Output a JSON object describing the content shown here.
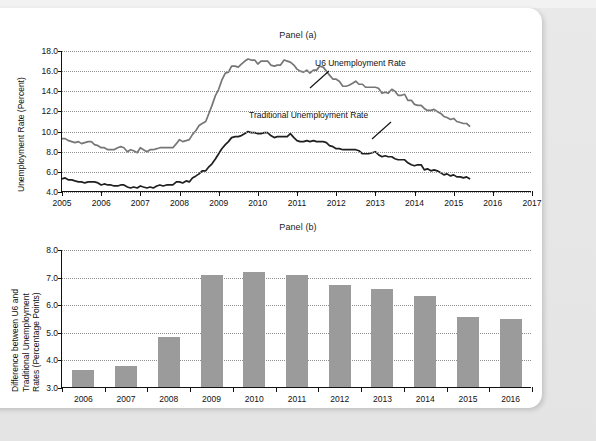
{
  "figure": {
    "panel_a_title": "Panel (a)",
    "panel_b_title": "Panel (b)"
  },
  "chart_data": [
    {
      "type": "line",
      "title": "Panel (a)",
      "xlabel": "",
      "ylabel": "Unemployment Rate (Percent)",
      "xlim": [
        2005,
        2017
      ],
      "ylim": [
        4.0,
        18.0
      ],
      "grid": true,
      "legend_position": "inline-annotation",
      "xticks": [
        "2005",
        "2006",
        "2007",
        "2008",
        "2009",
        "2010",
        "2011",
        "2012",
        "2013",
        "2014",
        "2015",
        "2016",
        "2017"
      ],
      "yticks": [
        "4.0",
        "6.0",
        "8.0",
        "10.0",
        "12.0",
        "14.0",
        "16.0",
        "18.0"
      ],
      "annotations": [
        {
          "text": "U6 Unemployment Rate",
          "points_to_series": "U6 Unemployment Rate"
        },
        {
          "text": "Traditional Unemployment Rate",
          "points_to_series": "Traditional Unemployment Rate"
        }
      ],
      "series": [
        {
          "name": "U6 Unemployment Rate",
          "color": "#767676",
          "x": [
            2005.0,
            2005.08,
            2005.17,
            2005.25,
            2005.33,
            2005.42,
            2005.5,
            2005.58,
            2005.67,
            2005.75,
            2005.83,
            2005.92,
            2006.0,
            2006.08,
            2006.17,
            2006.25,
            2006.33,
            2006.42,
            2006.5,
            2006.58,
            2006.67,
            2006.75,
            2006.83,
            2006.92,
            2007.0,
            2007.08,
            2007.17,
            2007.25,
            2007.33,
            2007.42,
            2007.5,
            2007.58,
            2007.67,
            2007.75,
            2007.83,
            2007.92,
            2008.0,
            2008.08,
            2008.17,
            2008.25,
            2008.33,
            2008.42,
            2008.5,
            2008.58,
            2008.67,
            2008.75,
            2008.83,
            2008.92,
            2009.0,
            2009.08,
            2009.17,
            2009.25,
            2009.33,
            2009.42,
            2009.5,
            2009.58,
            2009.67,
            2009.75,
            2009.83,
            2009.92,
            2010.0,
            2010.08,
            2010.17,
            2010.25,
            2010.33,
            2010.42,
            2010.5,
            2010.58,
            2010.67,
            2010.75,
            2010.83,
            2010.92,
            2011.0,
            2011.08,
            2011.17,
            2011.25,
            2011.33,
            2011.42,
            2011.5,
            2011.58,
            2011.67,
            2011.75,
            2011.83,
            2011.92,
            2012.0,
            2012.08,
            2012.17,
            2012.25,
            2012.33,
            2012.42,
            2012.5,
            2012.58,
            2012.67,
            2012.75,
            2012.83,
            2012.92,
            2013.0,
            2013.08,
            2013.17,
            2013.25,
            2013.33,
            2013.42,
            2013.5,
            2013.58,
            2013.67,
            2013.75,
            2013.83,
            2013.92,
            2014.0,
            2014.08,
            2014.17,
            2014.25,
            2014.33,
            2014.42,
            2014.5,
            2014.58,
            2014.67,
            2014.75,
            2014.83,
            2014.92,
            2015.0,
            2015.08,
            2015.17,
            2015.25,
            2015.33,
            2015.42
          ],
          "values": [
            9.3,
            9.3,
            9.1,
            9.0,
            8.9,
            9.0,
            8.8,
            8.9,
            9.0,
            9.0,
            8.7,
            8.6,
            8.4,
            8.4,
            8.2,
            8.2,
            8.2,
            8.4,
            8.5,
            8.4,
            8.0,
            8.2,
            8.1,
            7.9,
            8.4,
            8.2,
            8.0,
            8.2,
            8.2,
            8.3,
            8.4,
            8.4,
            8.4,
            8.4,
            8.4,
            8.8,
            9.2,
            9.0,
            9.1,
            9.2,
            9.7,
            10.1,
            10.6,
            10.8,
            11.0,
            11.8,
            12.6,
            13.6,
            14.2,
            15.1,
            15.8,
            15.9,
            16.5,
            16.5,
            16.4,
            16.7,
            17.0,
            17.2,
            17.1,
            17.1,
            16.7,
            17.0,
            17.0,
            17.0,
            16.6,
            16.5,
            16.6,
            16.6,
            17.1,
            17.0,
            16.9,
            16.6,
            16.2,
            16.0,
            15.9,
            16.1,
            15.8,
            16.1,
            16.1,
            16.5,
            16.4,
            16.0,
            15.6,
            15.2,
            15.2,
            15.0,
            14.5,
            14.5,
            14.6,
            14.8,
            15.0,
            14.7,
            14.7,
            14.4,
            14.4,
            14.4,
            14.4,
            14.3,
            13.8,
            13.9,
            13.8,
            14.2,
            14.0,
            13.6,
            13.6,
            13.7,
            13.1,
            13.1,
            12.7,
            12.6,
            12.6,
            12.3,
            12.1,
            12.1,
            12.2,
            12.0,
            11.8,
            11.5,
            11.4,
            11.2,
            11.3,
            11.0,
            10.9,
            10.8,
            10.8,
            10.5
          ]
        },
        {
          "name": "Traditional Unemployment Rate",
          "color": "#1f1f1f",
          "x": [
            2005.0,
            2005.08,
            2005.17,
            2005.25,
            2005.33,
            2005.42,
            2005.5,
            2005.58,
            2005.67,
            2005.75,
            2005.83,
            2005.92,
            2006.0,
            2006.08,
            2006.17,
            2006.25,
            2006.33,
            2006.42,
            2006.5,
            2006.58,
            2006.67,
            2006.75,
            2006.83,
            2006.92,
            2007.0,
            2007.08,
            2007.17,
            2007.25,
            2007.33,
            2007.42,
            2007.5,
            2007.58,
            2007.67,
            2007.75,
            2007.83,
            2007.92,
            2008.0,
            2008.08,
            2008.17,
            2008.25,
            2008.33,
            2008.42,
            2008.5,
            2008.58,
            2008.67,
            2008.75,
            2008.83,
            2008.92,
            2009.0,
            2009.08,
            2009.17,
            2009.25,
            2009.33,
            2009.42,
            2009.5,
            2009.58,
            2009.67,
            2009.75,
            2009.83,
            2009.92,
            2010.0,
            2010.08,
            2010.17,
            2010.25,
            2010.33,
            2010.42,
            2010.5,
            2010.58,
            2010.67,
            2010.75,
            2010.83,
            2010.92,
            2011.0,
            2011.08,
            2011.17,
            2011.25,
            2011.33,
            2011.42,
            2011.5,
            2011.58,
            2011.67,
            2011.75,
            2011.83,
            2011.92,
            2012.0,
            2012.08,
            2012.17,
            2012.25,
            2012.33,
            2012.42,
            2012.5,
            2012.58,
            2012.67,
            2012.75,
            2012.83,
            2012.92,
            2013.0,
            2013.08,
            2013.17,
            2013.25,
            2013.33,
            2013.42,
            2013.5,
            2013.58,
            2013.67,
            2013.75,
            2013.83,
            2013.92,
            2014.0,
            2014.08,
            2014.17,
            2014.25,
            2014.33,
            2014.42,
            2014.5,
            2014.58,
            2014.67,
            2014.75,
            2014.83,
            2014.92,
            2015.0,
            2015.08,
            2015.17,
            2015.25,
            2015.33,
            2015.42
          ],
          "values": [
            5.3,
            5.4,
            5.2,
            5.2,
            5.1,
            5.0,
            5.0,
            4.9,
            5.0,
            5.0,
            5.0,
            4.9,
            4.7,
            4.8,
            4.7,
            4.7,
            4.6,
            4.6,
            4.7,
            4.7,
            4.5,
            4.4,
            4.5,
            4.4,
            4.6,
            4.5,
            4.4,
            4.5,
            4.4,
            4.6,
            4.7,
            4.6,
            4.7,
            4.7,
            4.7,
            5.0,
            5.0,
            4.9,
            5.1,
            5.0,
            5.4,
            5.6,
            5.8,
            6.1,
            6.1,
            6.5,
            6.8,
            7.3,
            7.8,
            8.3,
            8.7,
            9.0,
            9.4,
            9.5,
            9.5,
            9.6,
            9.8,
            10.0,
            9.9,
            9.9,
            9.8,
            9.8,
            9.9,
            9.9,
            9.6,
            9.4,
            9.5,
            9.5,
            9.5,
            9.5,
            9.8,
            9.4,
            9.1,
            9.0,
            9.0,
            9.1,
            9.0,
            9.1,
            9.0,
            9.0,
            9.0,
            8.9,
            8.6,
            8.5,
            8.3,
            8.3,
            8.2,
            8.2,
            8.2,
            8.2,
            8.2,
            8.1,
            7.8,
            7.8,
            7.8,
            7.9,
            8.0,
            7.7,
            7.5,
            7.6,
            7.5,
            7.5,
            7.3,
            7.2,
            7.2,
            7.2,
            6.9,
            6.7,
            6.6,
            6.7,
            6.7,
            6.2,
            6.3,
            6.1,
            6.2,
            6.1,
            5.9,
            5.7,
            5.8,
            5.6,
            5.7,
            5.5,
            5.5,
            5.4,
            5.5,
            5.3
          ]
        }
      ]
    },
    {
      "type": "bar",
      "title": "Panel (b)",
      "xlabel": "",
      "ylabel": "Difference between U6 and Traditional Unemployment Rates (Percentage Points)",
      "ylabel_lines": [
        "Difference between U6 and",
        "Traditional Unemployment",
        "Rates (Percentage Points)"
      ],
      "ylim": [
        3.0,
        8.0
      ],
      "grid": true,
      "bar_color": "#9b9b9b",
      "categories": [
        "2006",
        "2007",
        "2008",
        "2009",
        "2010",
        "2011",
        "2012",
        "2013",
        "2014",
        "2015",
        "2016"
      ],
      "values": [
        3.6,
        3.75,
        4.8,
        7.05,
        7.15,
        7.05,
        6.7,
        6.55,
        6.3,
        5.55,
        5.45
      ],
      "yticks": [
        "3.0",
        "4.0",
        "5.0",
        "6.0",
        "7.0",
        "8.0"
      ]
    }
  ]
}
